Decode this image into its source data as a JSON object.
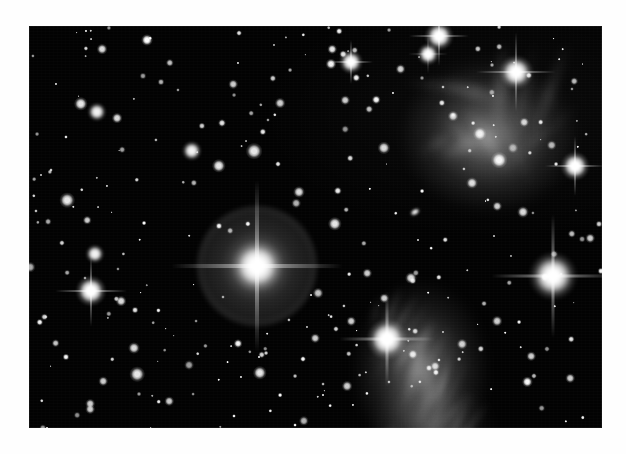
{
  "page": {
    "background_color": "#ffffff",
    "kind": "astronomical-photograph"
  },
  "photo": {
    "background_color": "#000000",
    "left": 29,
    "top": 26,
    "width": 573,
    "height": 402,
    "alt_text": "Deep-sky photograph of a star cluster with bright stars surrounded by reflection nebulosity"
  },
  "chart_data": {
    "type": "scatter",
    "title": "",
    "xlabel": "",
    "ylabel": "",
    "xlim": [
      0,
      573
    ],
    "ylim": [
      0,
      402
    ],
    "grid": false,
    "legend": null,
    "note": "Positions in photo-local pixels; 'r' is rendered glow radius in px, 'b' is peak brightness 0-1",
    "stars": [
      {
        "x": 118,
        "y": 14,
        "r": 5.0,
        "b": 1.0
      },
      {
        "x": 303,
        "y": 23,
        "r": 4.0,
        "b": 0.9
      },
      {
        "x": 322,
        "y": 36,
        "r": 10.0,
        "b": 1.0,
        "spikes": 22
      },
      {
        "x": 410,
        "y": 10,
        "r": 12.0,
        "b": 1.0,
        "spikes": 30
      },
      {
        "x": 399,
        "y": 28,
        "r": 9.0,
        "b": 1.0,
        "spikes": 20
      },
      {
        "x": 487,
        "y": 46,
        "r": 14.0,
        "b": 1.0,
        "spikes": 40
      },
      {
        "x": 546,
        "y": 140,
        "r": 12.0,
        "b": 1.0,
        "spikes": 30
      },
      {
        "x": 524,
        "y": 250,
        "r": 20.0,
        "b": 1.0,
        "spikes": 62
      },
      {
        "x": 358,
        "y": 313,
        "r": 17.0,
        "b": 1.0,
        "spikes": 48
      },
      {
        "x": 228,
        "y": 240,
        "r": 22.0,
        "b": 1.0,
        "spikes": 86,
        "halo": 62
      },
      {
        "x": 66,
        "y": 228,
        "r": 8.0,
        "b": 0.95
      },
      {
        "x": 62,
        "y": 265,
        "r": 13.0,
        "b": 1.0,
        "spikes": 36
      },
      {
        "x": 68,
        "y": 86,
        "r": 8.0,
        "b": 0.95
      },
      {
        "x": 52,
        "y": 78,
        "r": 6.0,
        "b": 0.9
      },
      {
        "x": 88,
        "y": 92,
        "r": 4.5,
        "b": 0.85
      },
      {
        "x": 163,
        "y": 125,
        "r": 8.5,
        "b": 0.95
      },
      {
        "x": 190,
        "y": 140,
        "r": 6.0,
        "b": 0.9
      },
      {
        "x": 38,
        "y": 174,
        "r": 6.5,
        "b": 0.9
      },
      {
        "x": 225,
        "y": 125,
        "r": 7.0,
        "b": 0.9
      },
      {
        "x": 270,
        "y": 166,
        "r": 5.0,
        "b": 0.85
      },
      {
        "x": 355,
        "y": 122,
        "r": 5.5,
        "b": 0.85
      },
      {
        "x": 306,
        "y": 198,
        "r": 6.0,
        "b": 0.9
      },
      {
        "x": 316,
        "y": 74,
        "r": 4.0,
        "b": 0.8
      },
      {
        "x": 251,
        "y": 77,
        "r": 4.5,
        "b": 0.8
      },
      {
        "x": 141,
        "y": 37,
        "r": 3.5,
        "b": 0.75
      },
      {
        "x": 204,
        "y": 58,
        "r": 4.0,
        "b": 0.8
      },
      {
        "x": 92,
        "y": 275,
        "r": 4.5,
        "b": 0.85
      },
      {
        "x": 105,
        "y": 322,
        "r": 5.0,
        "b": 0.85
      },
      {
        "x": 108,
        "y": 348,
        "r": 6.5,
        "b": 0.9
      },
      {
        "x": 74,
        "y": 355,
        "r": 4.0,
        "b": 0.8
      },
      {
        "x": 140,
        "y": 375,
        "r": 4.0,
        "b": 0.8
      },
      {
        "x": 61,
        "y": 383,
        "r": 4.0,
        "b": 0.8
      },
      {
        "x": 231,
        "y": 347,
        "r": 6.0,
        "b": 0.9
      },
      {
        "x": 286,
        "y": 312,
        "r": 4.0,
        "b": 0.8
      },
      {
        "x": 322,
        "y": 295,
        "r": 4.0,
        "b": 0.8
      },
      {
        "x": 318,
        "y": 360,
        "r": 4.5,
        "b": 0.8
      },
      {
        "x": 406,
        "y": 340,
        "r": 4.0,
        "b": 0.8
      },
      {
        "x": 433,
        "y": 318,
        "r": 4.5,
        "b": 0.8
      },
      {
        "x": 468,
        "y": 295,
        "r": 4.5,
        "b": 0.8
      },
      {
        "x": 494,
        "y": 186,
        "r": 5.0,
        "b": 0.85
      },
      {
        "x": 502,
        "y": 330,
        "r": 4.0,
        "b": 0.8
      },
      {
        "x": 541,
        "y": 352,
        "r": 4.0,
        "b": 0.8
      },
      {
        "x": 561,
        "y": 212,
        "r": 4.0,
        "b": 0.8
      },
      {
        "x": 451,
        "y": 108,
        "r": 6.0,
        "b": 0.9
      },
      {
        "x": 470,
        "y": 134,
        "r": 7.0,
        "b": 0.95
      },
      {
        "x": 443,
        "y": 157,
        "r": 5.0,
        "b": 0.85
      },
      {
        "x": 424,
        "y": 90,
        "r": 4.5,
        "b": 0.8
      },
      {
        "x": 495,
        "y": 96,
        "r": 4.0,
        "b": 0.8
      },
      {
        "x": 468,
        "y": 180,
        "r": 4.0,
        "b": 0.8
      },
      {
        "x": 382,
        "y": 252,
        "r": 5.0,
        "b": 0.85
      },
      {
        "x": 355,
        "y": 272,
        "r": 4.0,
        "b": 0.8
      },
      {
        "x": 338,
        "y": 247,
        "r": 4.0,
        "b": 0.8
      }
    ],
    "faint_star_count": 260,
    "nebulae": [
      {
        "name": "upper-right-reflection-nebula",
        "x": 460,
        "y": 110,
        "rx": 90,
        "ry": 78,
        "intensity": 0.34
      },
      {
        "name": "lower-right-reflection-nebula",
        "x": 392,
        "y": 345,
        "rx": 70,
        "ry": 92,
        "intensity": 0.32
      },
      {
        "name": "bottom-nebulosity-tail",
        "x": 404,
        "y": 400,
        "rx": 62,
        "ry": 46,
        "intensity": 0.2
      }
    ],
    "artifacts": [
      {
        "name": "elongated-blob",
        "x": 386,
        "y": 186,
        "w": 11,
        "h": 7,
        "angle": -30
      }
    ]
  }
}
